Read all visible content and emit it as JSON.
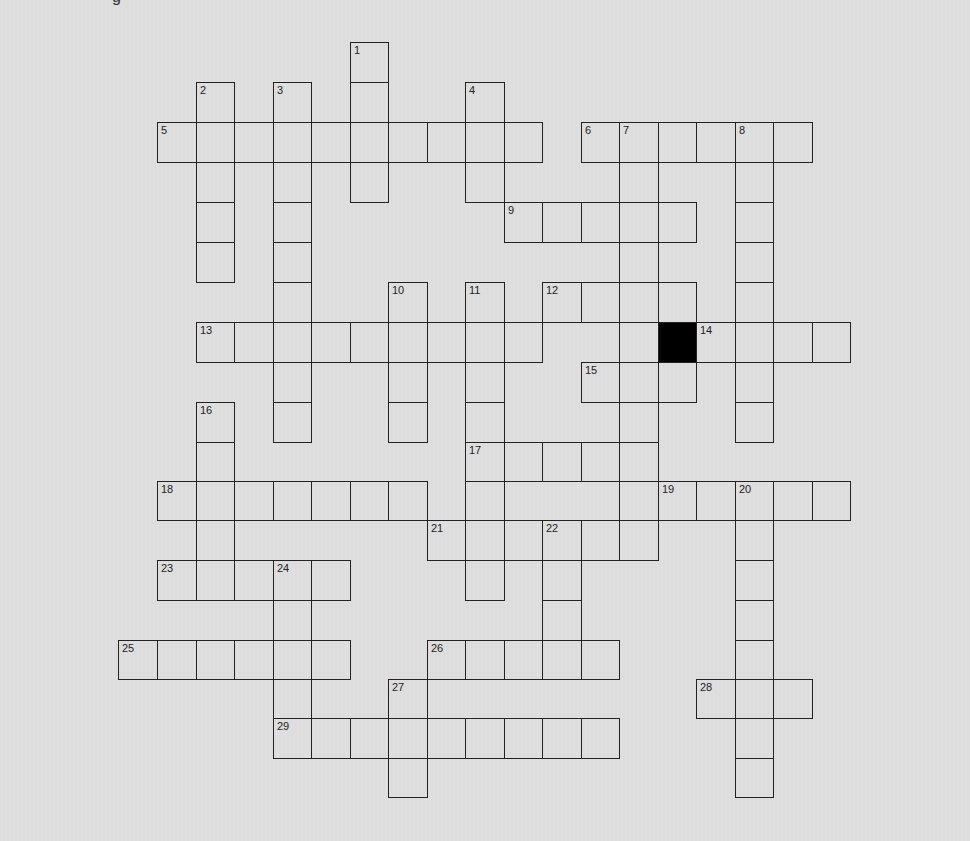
{
  "page": {
    "top_fragment": "g",
    "background": "#dedede",
    "line_color": "#222222",
    "black_cell_color": "#000000"
  },
  "grid": {
    "col_edges": [
      118,
      157,
      196,
      234,
      273,
      311,
      350,
      388,
      427,
      465,
      504,
      542,
      581,
      619,
      658,
      696,
      735,
      773,
      812,
      850
    ],
    "row_edges": [
      42,
      82,
      122,
      162,
      202,
      242,
      282,
      322,
      362,
      402,
      442,
      481,
      520,
      560,
      600,
      640,
      679,
      718,
      758,
      797
    ]
  },
  "clues": {
    "down": [
      {
        "num": 1,
        "col": 6,
        "row": 0,
        "length": 4
      },
      {
        "num": 2,
        "col": 2,
        "row": 1,
        "length": 5
      },
      {
        "num": 3,
        "col": 4,
        "row": 1,
        "length": 9
      },
      {
        "num": 4,
        "col": 9,
        "row": 1,
        "length": 3
      },
      {
        "num": 7,
        "col": 13,
        "row": 2,
        "length": 10
      },
      {
        "num": 8,
        "col": 16,
        "row": 2,
        "length": 8
      },
      {
        "num": 10,
        "col": 7,
        "row": 6,
        "length": 4
      },
      {
        "num": 11,
        "col": 9,
        "row": 6,
        "length": 8
      },
      {
        "num": 16,
        "col": 2,
        "row": 9,
        "length": 5
      },
      {
        "num": 20,
        "col": 16,
        "row": 11,
        "length": 8
      },
      {
        "num": 22,
        "col": 11,
        "row": 12,
        "length": 4
      },
      {
        "num": 24,
        "col": 4,
        "row": 13,
        "length": 5
      },
      {
        "num": 27,
        "col": 7,
        "row": 16,
        "length": 3
      }
    ],
    "across": [
      {
        "num": 5,
        "col": 1,
        "row": 2,
        "length": 10
      },
      {
        "num": 6,
        "col": 12,
        "row": 2,
        "length": 6
      },
      {
        "num": 9,
        "col": 10,
        "row": 4,
        "length": 5
      },
      {
        "num": 12,
        "col": 11,
        "row": 6,
        "length": 4
      },
      {
        "num": 13,
        "col": 2,
        "row": 7,
        "length": 9
      },
      {
        "num": 14,
        "col": 15,
        "row": 7,
        "length": 4
      },
      {
        "num": 15,
        "col": 12,
        "row": 8,
        "length": 3
      },
      {
        "num": 17,
        "col": 9,
        "row": 10,
        "length": 5
      },
      {
        "num": 18,
        "col": 1,
        "row": 11,
        "length": 7
      },
      {
        "num": 19,
        "col": 14,
        "row": 11,
        "length": 5
      },
      {
        "num": 21,
        "col": 8,
        "row": 12,
        "length": 6
      },
      {
        "num": 23,
        "col": 1,
        "row": 13,
        "length": 5
      },
      {
        "num": 25,
        "col": 0,
        "row": 15,
        "length": 6
      },
      {
        "num": 26,
        "col": 8,
        "row": 15,
        "length": 5
      },
      {
        "num": 28,
        "col": 15,
        "row": 16,
        "length": 3
      },
      {
        "num": 29,
        "col": 4,
        "row": 17,
        "length": 9
      }
    ]
  },
  "black_cells": [
    {
      "col": 14,
      "row": 7
    }
  ]
}
